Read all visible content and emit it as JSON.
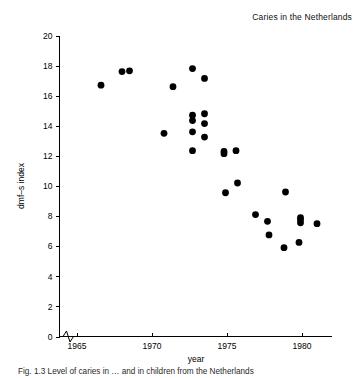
{
  "figure": {
    "title": "Caries in the Netherlands",
    "caption": "Fig. 1.3 Level of caries in … and in children from the Netherlands"
  },
  "chart_data": {
    "type": "scatter",
    "title": "Caries in the Netherlands",
    "xlabel": "year",
    "ylabel": "dmf–s index",
    "xlim": [
      1964.2,
      1982.0
    ],
    "ylim": [
      0,
      20
    ],
    "xticks": [
      1965,
      1970,
      1975,
      1980
    ],
    "xtick_labels": [
      "1965",
      "1970",
      "1975",
      "1980"
    ],
    "yticks": [
      0,
      2,
      4,
      6,
      8,
      10,
      12,
      14,
      16,
      18,
      20
    ],
    "ytick_labels": [
      "0",
      "2",
      "4",
      "6",
      "8",
      "10",
      "12",
      "14",
      "16",
      "18",
      "20"
    ],
    "grid": false,
    "legend": null,
    "axis_break": {
      "axis": "x",
      "position": 1964.6,
      "style": "zigzag"
    },
    "marker": {
      "shape": "circle",
      "color": "#000000",
      "size": 3.4
    },
    "points": [
      {
        "x": 1966.6,
        "y": 16.7
      },
      {
        "x": 1968.0,
        "y": 17.6
      },
      {
        "x": 1968.5,
        "y": 17.65
      },
      {
        "x": 1970.8,
        "y": 13.5
      },
      {
        "x": 1971.4,
        "y": 16.6
      },
      {
        "x": 1972.7,
        "y": 17.8
      },
      {
        "x": 1972.7,
        "y": 14.7
      },
      {
        "x": 1972.7,
        "y": 14.35
      },
      {
        "x": 1972.7,
        "y": 13.6
      },
      {
        "x": 1972.7,
        "y": 12.35
      },
      {
        "x": 1973.5,
        "y": 17.15
      },
      {
        "x": 1973.5,
        "y": 14.8
      },
      {
        "x": 1973.5,
        "y": 14.15
      },
      {
        "x": 1973.5,
        "y": 13.25
      },
      {
        "x": 1974.8,
        "y": 12.3
      },
      {
        "x": 1974.8,
        "y": 12.15
      },
      {
        "x": 1975.6,
        "y": 12.35
      },
      {
        "x": 1974.9,
        "y": 9.55
      },
      {
        "x": 1975.7,
        "y": 10.2
      },
      {
        "x": 1976.9,
        "y": 8.1
      },
      {
        "x": 1977.7,
        "y": 7.65
      },
      {
        "x": 1977.8,
        "y": 6.75
      },
      {
        "x": 1978.9,
        "y": 9.6
      },
      {
        "x": 1978.8,
        "y": 5.9
      },
      {
        "x": 1979.9,
        "y": 7.9
      },
      {
        "x": 1979.9,
        "y": 7.75
      },
      {
        "x": 1979.9,
        "y": 7.55
      },
      {
        "x": 1979.8,
        "y": 6.25
      },
      {
        "x": 1981.0,
        "y": 7.5
      }
    ]
  }
}
